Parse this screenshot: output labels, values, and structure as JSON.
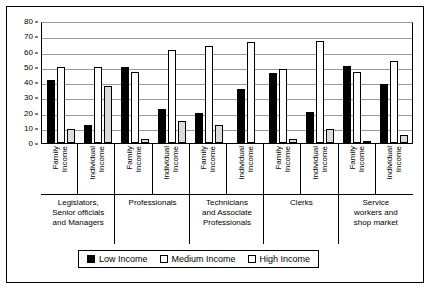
{
  "chart_data": {
    "type": "bar",
    "title": "",
    "subtitle": "",
    "xlabel": "",
    "ylabel": "",
    "ylim": [
      0,
      80
    ],
    "yticks": [
      0,
      10,
      20,
      30,
      40,
      50,
      60,
      70,
      80
    ],
    "ytick_labels": [
      "0",
      "10",
      "20",
      "30",
      "40",
      "50",
      "60",
      "70",
      "80"
    ],
    "grid": true,
    "legend_position": "bottom",
    "series": [
      {
        "name": "Low Income",
        "color": "#000000",
        "values": [
          41,
          12,
          50,
          22,
          20,
          35.5,
          46,
          20.5,
          50.5,
          39
        ]
      },
      {
        "name": "Medium Income",
        "color": "#ffffff",
        "values": [
          50,
          50,
          46.5,
          61,
          63.5,
          66.5,
          48.5,
          67,
          46.5,
          54
        ]
      },
      {
        "name": "High Income",
        "color": "#dcdcdc",
        "values": [
          9,
          37.5,
          2.5,
          14.5,
          11.5,
          0,
          2.5,
          9.5,
          1.5,
          5
        ]
      }
    ],
    "categories": [
      "Family Income",
      "Individual Income",
      "Family Income",
      "Individual Income",
      "Family Income",
      "Individual Income",
      "Family Income",
      "Individual Income",
      "Family Income",
      "Individual Income"
    ],
    "group_labels": [
      "Legislators, Senior officials and Managers",
      "Professionals",
      "Technicians and Associate Professionals",
      "Clerks",
      "Service workers and shop market"
    ]
  },
  "axis": {
    "y": {
      "ticks": [
        {
          "label": "80",
          "value": 80
        },
        {
          "label": "70",
          "value": 70
        },
        {
          "label": "60",
          "value": 60
        },
        {
          "label": "50",
          "value": 50
        },
        {
          "label": "40",
          "value": 40
        },
        {
          "label": "30",
          "value": 30
        },
        {
          "label": "20",
          "value": 20
        },
        {
          "label": "10",
          "value": 10
        },
        {
          "label": "0",
          "value": 0
        }
      ]
    }
  },
  "groups": [
    {
      "name": "Legislators, Senior officials and Managers",
      "label_lines": [
        "Legislators,",
        "Senior officials",
        "and Managers"
      ],
      "subgroups": [
        {
          "label_line1": "Family",
          "label_line2": "Income",
          "low": 41,
          "medium": 50,
          "high": 9
        },
        {
          "label_line1": "Individual",
          "label_line2": "Income",
          "low": 12,
          "medium": 50,
          "high": 37.5
        }
      ]
    },
    {
      "name": "Professionals",
      "label_lines": [
        "Professionals"
      ],
      "subgroups": [
        {
          "label_line1": "Family",
          "label_line2": "Income",
          "low": 50,
          "medium": 46.5,
          "high": 2.5
        },
        {
          "label_line1": "Individual",
          "label_line2": "Income",
          "low": 22,
          "medium": 61,
          "high": 14.5
        }
      ]
    },
    {
      "name": "Technicians and Associate Professionals",
      "label_lines": [
        "Technicians",
        "and Associate",
        "Professionals"
      ],
      "subgroups": [
        {
          "label_line1": "Family",
          "label_line2": "Income",
          "low": 20,
          "medium": 63.5,
          "high": 11.5
        },
        {
          "label_line1": "Individual",
          "label_line2": "Income",
          "low": 35.5,
          "medium": 66.5,
          "high": 0
        }
      ]
    },
    {
      "name": "Clerks",
      "label_lines": [
        "Clerks"
      ],
      "subgroups": [
        {
          "label_line1": "Family",
          "label_line2": "Income",
          "low": 46,
          "medium": 48.5,
          "high": 2.5
        },
        {
          "label_line1": "Individual",
          "label_line2": "Income",
          "low": 20.5,
          "medium": 67,
          "high": 9.5
        }
      ]
    },
    {
      "name": "Service workers and shop market",
      "label_lines": [
        "Service",
        "workers and",
        "shop market"
      ],
      "subgroups": [
        {
          "label_line1": "Family",
          "label_line2": "Income",
          "low": 50.5,
          "medium": 46.5,
          "high": 1.5
        },
        {
          "label_line1": "Individual",
          "label_line2": "Income",
          "low": 39,
          "medium": 54,
          "high": 5
        }
      ]
    }
  ],
  "legend": {
    "items": [
      {
        "label": "Low Income",
        "color": "#000000"
      },
      {
        "label": "Medium Income",
        "color": "#ffffff"
      },
      {
        "label": "High Income",
        "color": "#ffffff"
      }
    ]
  }
}
